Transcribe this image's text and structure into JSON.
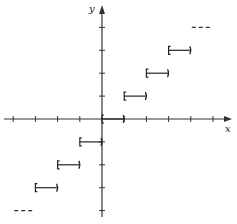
{
  "chart_data": {
    "type": "line",
    "title": "",
    "function": "floor(x)",
    "xlabel": "x",
    "ylabel": "y",
    "xlim": [
      -4,
      5
    ],
    "ylim": [
      -4,
      4
    ],
    "grid": false,
    "x_ticks": [
      -4,
      -3,
      -2,
      -1,
      0,
      1,
      2,
      3,
      4,
      5
    ],
    "y_ticks": [
      -4,
      -3,
      -2,
      -1,
      0,
      1,
      2,
      3,
      4
    ],
    "series": [
      {
        "name": "step",
        "segments": [
          {
            "x0": -3,
            "x1": -2,
            "y": -3,
            "left": "closed",
            "right": "open"
          },
          {
            "x0": -2,
            "x1": -1,
            "y": -2,
            "left": "closed",
            "right": "open"
          },
          {
            "x0": -1,
            "x1": 0,
            "y": -1,
            "left": "closed",
            "right": "open"
          },
          {
            "x0": 0,
            "x1": 1,
            "y": 0,
            "left": "closed",
            "right": "open"
          },
          {
            "x0": 1,
            "x1": 2,
            "y": 1,
            "left": "closed",
            "right": "open"
          },
          {
            "x0": 2,
            "x1": 3,
            "y": 2,
            "left": "closed",
            "right": "open"
          },
          {
            "x0": 3,
            "x1": 4,
            "y": 3,
            "left": "closed",
            "right": "open"
          }
        ]
      }
    ],
    "continuation": [
      {
        "x0": 4,
        "x1": 5,
        "y": 4,
        "style": "dashed"
      },
      {
        "x0": -4,
        "x1": -3,
        "y": -4,
        "style": "dashed"
      }
    ]
  },
  "axis_labels": {
    "x": "x",
    "y": "y"
  }
}
